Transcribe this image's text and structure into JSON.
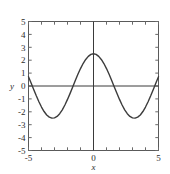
{
  "chart_data": {
    "type": "line",
    "title": "",
    "xlabel": "x",
    "ylabel": "y",
    "xlim": [
      -5,
      5
    ],
    "ylim": [
      -5,
      5
    ],
    "grid": false,
    "legend": null,
    "x_tick_labels": [
      "-5",
      "0",
      "5"
    ],
    "x_tick_values": [
      -5,
      0,
      5
    ],
    "y_tick_labels": [
      "5",
      "4",
      "3",
      "2",
      "1",
      "0",
      "-1",
      "-2",
      "-3",
      "-4",
      "-5"
    ],
    "y_tick_values": [
      5,
      4,
      3,
      2,
      1,
      0,
      -1,
      -2,
      -3,
      -4,
      -5
    ],
    "x_minor_tick_step": 1,
    "y_minor_tick_step": 1,
    "series": [
      {
        "name": "y = 2.5 cos(x)",
        "color": "#3c3c3c",
        "expression": "2.5*cos(x)",
        "amplitude": 2.5,
        "x": [
          -5.0,
          -4.8,
          -4.6,
          -4.4,
          -4.2,
          -4.0,
          -3.8,
          -3.6,
          -3.4,
          -3.2,
          -3.0,
          -2.8,
          -2.6,
          -2.4,
          -2.2,
          -2.0,
          -1.8,
          -1.6,
          -1.4,
          -1.2,
          -1.0,
          -0.8,
          -0.6,
          -0.4,
          -0.2,
          0.0,
          0.2,
          0.4,
          0.6,
          0.8,
          1.0,
          1.2,
          1.4,
          1.6,
          1.8,
          2.0,
          2.2,
          2.4,
          2.6,
          2.8,
          3.0,
          3.2,
          3.4,
          3.6,
          3.8,
          4.0,
          4.2,
          4.4,
          4.6,
          4.8,
          5.0
        ],
        "y": [
          0.71,
          0.23,
          -0.27,
          -0.76,
          -1.22,
          -1.63,
          -1.98,
          -2.25,
          -2.41,
          -2.49,
          -2.47,
          -2.36,
          -2.15,
          -1.85,
          -1.47,
          -1.04,
          -0.57,
          -0.07,
          0.42,
          0.91,
          1.35,
          1.74,
          2.06,
          2.3,
          2.45,
          2.5,
          2.45,
          2.3,
          2.06,
          1.74,
          1.35,
          0.91,
          0.42,
          -0.07,
          -0.57,
          -1.04,
          -1.47,
          -1.85,
          -2.15,
          -2.36,
          -2.47,
          -2.49,
          -2.41,
          -2.25,
          -1.98,
          -1.63,
          -1.22,
          -0.76,
          -0.27,
          0.23,
          0.71
        ]
      }
    ],
    "annotations": {
      "maximum": {
        "x": 0,
        "y": 2.5
      },
      "minima": [
        {
          "x": -3.14,
          "y": -2.5
        },
        {
          "x": 3.14,
          "y": -2.5
        }
      ],
      "zero_crossings": [
        -4.71,
        -1.57,
        1.57,
        4.71
      ]
    }
  }
}
